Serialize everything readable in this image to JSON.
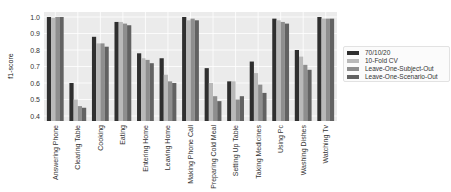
{
  "chart_data": {
    "type": "bar",
    "title": "",
    "xlabel": "",
    "ylabel": "f1-score",
    "ylim": [
      0.4,
      1.0
    ],
    "yticks": [
      "0.4",
      "0.5",
      "0.6",
      "0.7",
      "0.8",
      "0.9",
      "1.0"
    ],
    "grid": true,
    "legend_position": "right",
    "categories": [
      "Answering Phone",
      "Clearing Table",
      "Cooking",
      "Eating",
      "Entering Home",
      "Leaving Home",
      "Making Phone Call",
      "Preparing Cold Meal",
      "Setting Up Table",
      "Taking Medicines",
      "Using Pc",
      "Washing Dishes",
      "Watching Tv"
    ],
    "series": [
      {
        "name": "70/10/20",
        "color": "#2f2f2f",
        "values": [
          1.0,
          0.6,
          0.88,
          0.97,
          0.78,
          0.75,
          1.0,
          0.69,
          0.61,
          0.73,
          0.99,
          0.8,
          1.0
        ]
      },
      {
        "name": "10-Fold CV",
        "color": "#b9b9b9",
        "values": [
          0.995,
          0.5,
          0.84,
          0.97,
          0.75,
          0.65,
          0.98,
          0.6,
          0.61,
          0.66,
          0.98,
          0.76,
          0.99
        ]
      },
      {
        "name": "Leave-One-Subject-Out",
        "color": "#8e8e8e",
        "values": [
          1.0,
          0.46,
          0.84,
          0.96,
          0.74,
          0.61,
          0.99,
          0.52,
          0.5,
          0.59,
          0.97,
          0.71,
          0.99
        ]
      },
      {
        "name": "Leave-One-Scenario-Out",
        "color": "#626262",
        "values": [
          1.0,
          0.45,
          0.82,
          0.95,
          0.72,
          0.6,
          0.98,
          0.49,
          0.52,
          0.54,
          0.96,
          0.68,
          0.99
        ]
      }
    ]
  },
  "colors": {
    "plot_background": "#ebebeb",
    "grid": "#ffffff"
  }
}
